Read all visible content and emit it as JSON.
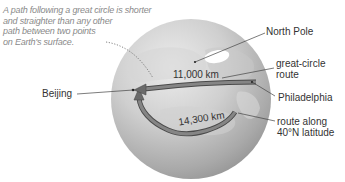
{
  "caption": {
    "lines": [
      "A path following a great circle is shorter",
      "and straighter than any other",
      "path between two points",
      "on Earth's surface."
    ]
  },
  "labels": {
    "north_pole": "North Pole",
    "great_circle_route": [
      "great-circle",
      "route"
    ],
    "philadelphia": "Philadelphia",
    "latitude_route": [
      "route along",
      "40°N latitude"
    ],
    "beijing": "Beijing"
  },
  "distances": {
    "great_circle": "11,000 km",
    "latitude": "14,300 km"
  },
  "colors": {
    "globe_light": "#e4e4e4",
    "globe_mid": "#bdbdbd",
    "globe_dark": "#8c8c8c",
    "arrow_fill": "#7a7a7a",
    "arrow_edge": "#4a4a4a",
    "label_text": "#333333",
    "caption_text": "#8a8a8a",
    "leader_line": "#444444"
  }
}
